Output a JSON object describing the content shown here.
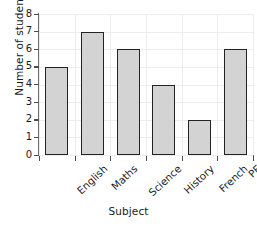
{
  "chart_data": {
    "type": "bar",
    "title": "",
    "xlabel": "Subject",
    "ylabel": "Number of students",
    "categories": [
      "English",
      "Maths",
      "Science",
      "History",
      "French",
      "PE"
    ],
    "values": [
      5,
      7,
      6,
      4,
      2,
      6
    ],
    "ylim": [
      0,
      8
    ],
    "y_ticks": [
      0,
      1,
      2,
      3,
      4,
      5,
      6,
      7,
      8
    ],
    "y_tick_labels": [
      "0",
      "1",
      "2",
      "3",
      "4",
      "5",
      "6",
      "7",
      "8"
    ],
    "grid": true,
    "legend": false,
    "bar_fill_color": "#d3d3d3",
    "bar_edge_color": "#232323",
    "gridline_color": "#ededed",
    "axis_color": "#6e6e6e",
    "background_color": "#ffffff"
  }
}
